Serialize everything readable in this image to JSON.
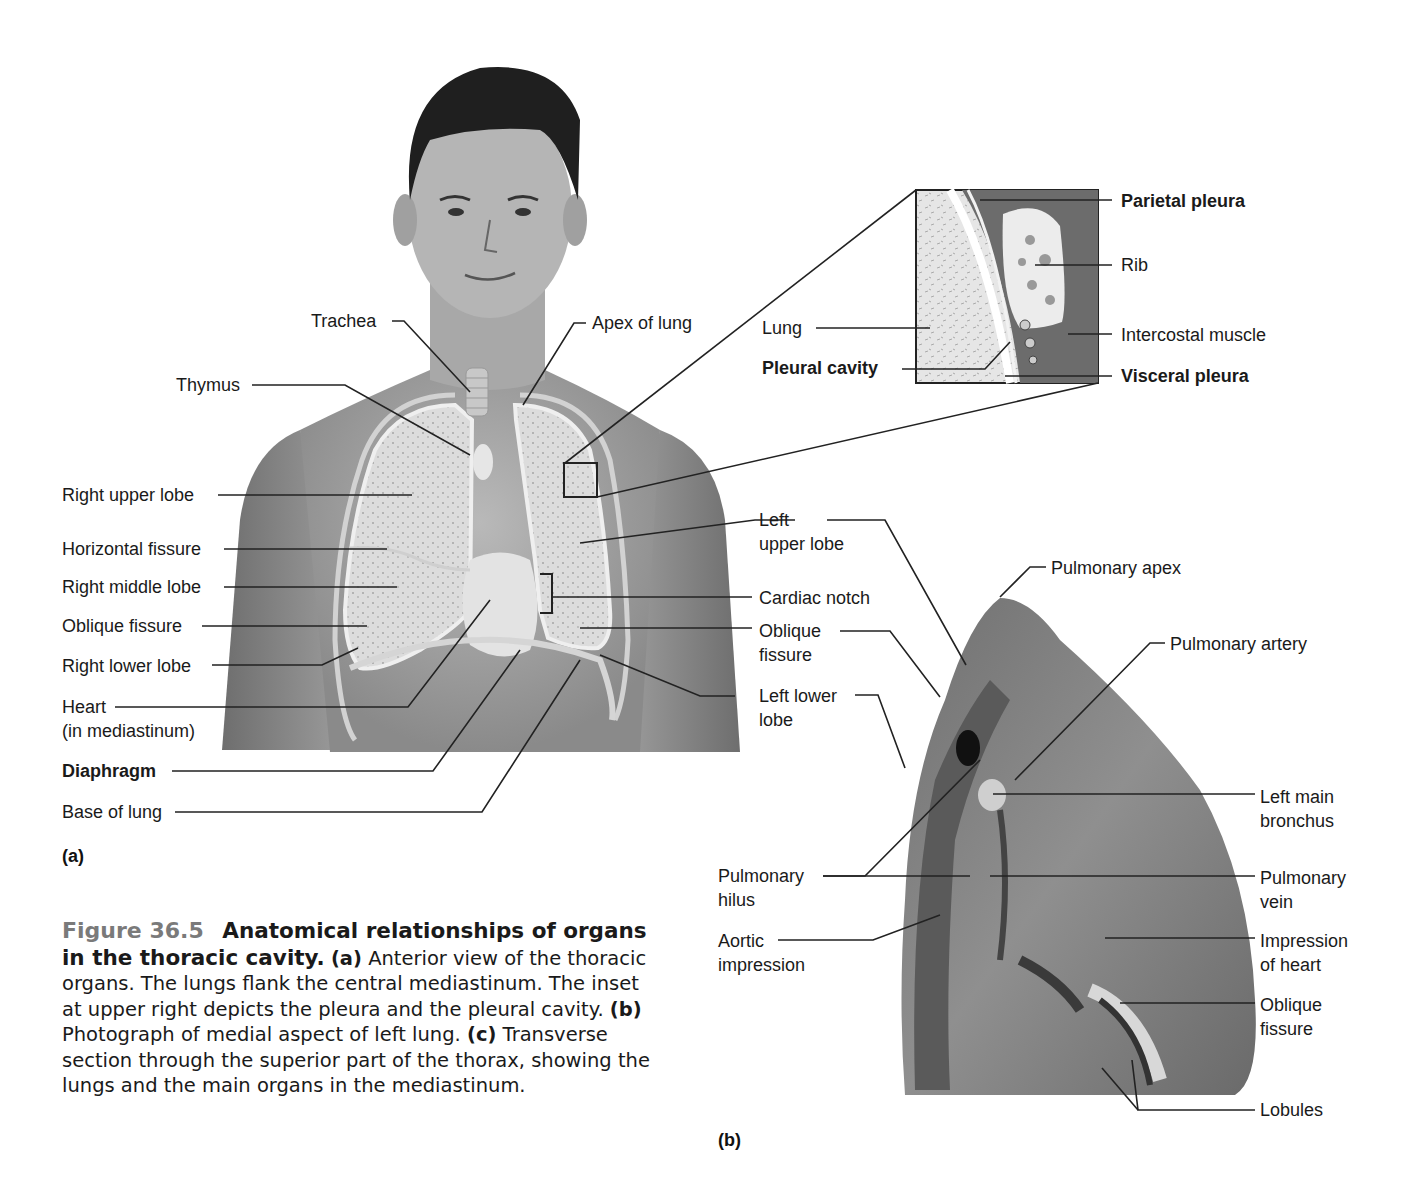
{
  "figure": {
    "number": "Figure 36.5",
    "title": "Anatomical relationships of organs in the thoracic cavity.",
    "caption_parts": {
      "a_label": "(a)",
      "a_text": " Anterior view of the thoracic organs. The lungs flank the central mediastinum. The inset at upper right depicts the pleura and the pleural cavity. ",
      "b_label": "(b)",
      "b_text": " Photograph of medial aspect of left lung. ",
      "c_label": "(c)",
      "c_text": " Transverse section through the superior part of the thorax, showing the lungs and the main organs in the mediastinum."
    }
  },
  "panel_a": {
    "letter": "(a)",
    "labels": {
      "trachea": "Trachea",
      "apex_of_lung": "Apex of lung",
      "thymus": "Thymus",
      "right_upper_lobe": "Right upper lobe",
      "horizontal_fissure": "Horizontal fissure",
      "right_middle_lobe": "Right middle lobe",
      "oblique_fissure": "Oblique fissure",
      "right_lower_lobe": "Right lower lobe",
      "heart": "Heart\n(in mediastinum)",
      "diaphragm": "Diaphragm",
      "base_of_lung": "Base of lung",
      "left_upper_lobe": "Left\nupper lobe",
      "cardiac_notch": "Cardiac notch",
      "oblique_fissure_left": "Oblique\nfissure",
      "left_lower_lobe": "Left lower\nlobe"
    }
  },
  "inset": {
    "labels": {
      "parietal_pleura": "Parietal pleura",
      "rib": "Rib",
      "lung": "Lung",
      "intercostal_muscle": "Intercostal muscle",
      "pleural_cavity": "Pleural cavity",
      "visceral_pleura": "Visceral pleura"
    }
  },
  "panel_b": {
    "letter": "(b)",
    "labels": {
      "pulmonary_apex": "Pulmonary apex",
      "pulmonary_artery": "Pulmonary artery",
      "left_main_bronchus": "Left main\nbronchus",
      "pulmonary_hilus": "Pulmonary\nhilus",
      "pulmonary_vein": "Pulmonary\nvein",
      "aortic_impression": "Aortic\nimpression",
      "impression_of_heart": "Impression\nof heart",
      "oblique_fissure": "Oblique\nfissure",
      "lobules": "Lobules"
    }
  }
}
